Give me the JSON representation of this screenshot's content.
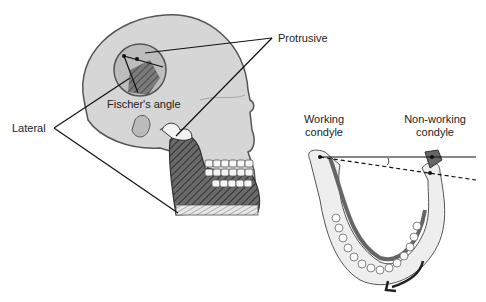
{
  "labels": {
    "protrusive": "Protrusive",
    "lateral": "Lateral",
    "fischers_angle": "Fischer's angle",
    "working_condyle_line1": "Working",
    "working_condyle_line2": "condyle",
    "non_working_condyle_line1": "Non-working",
    "non_working_condyle_line2": "condyle"
  },
  "colors": {
    "skull_fill": "#d9d9d9",
    "mandible_fill": "#555555",
    "line": "#111111",
    "bone_light": "#eeeeee"
  }
}
